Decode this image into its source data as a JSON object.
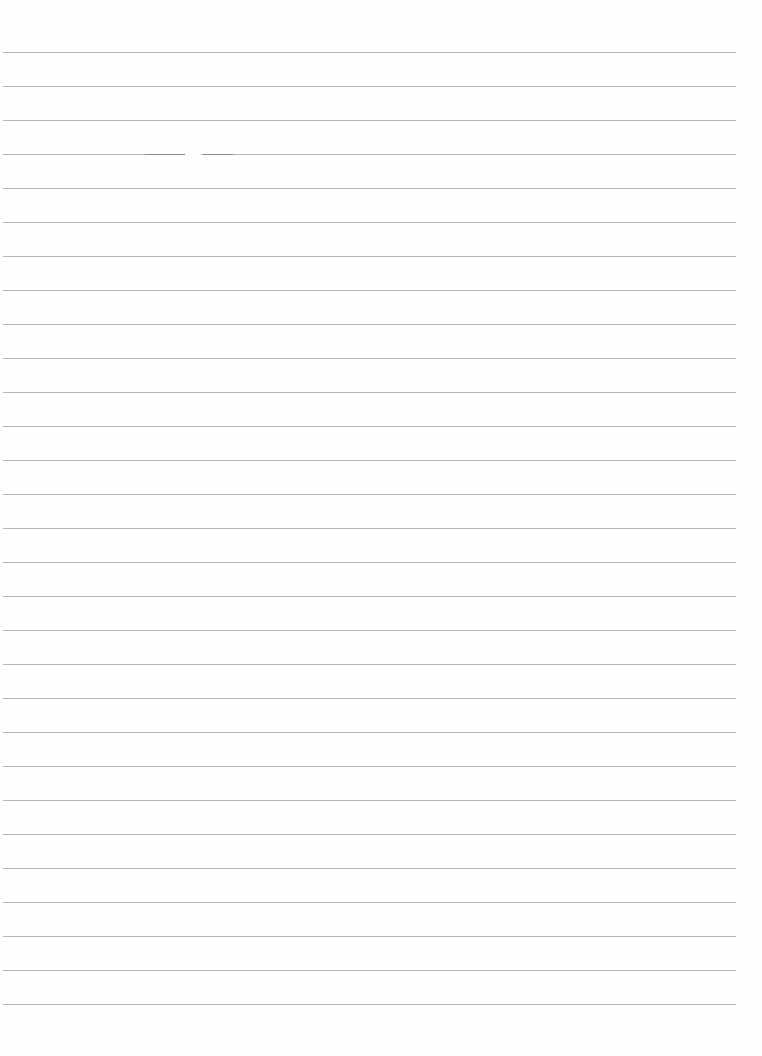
{
  "page": {
    "type": "blank lined paper",
    "line_count": 29,
    "first_line_y": 52,
    "line_spacing": 34,
    "line_left": 3,
    "line_right": 736,
    "line_color": "#b4b4b4",
    "background_color": "#fefefe"
  },
  "content": {
    "text": ""
  }
}
